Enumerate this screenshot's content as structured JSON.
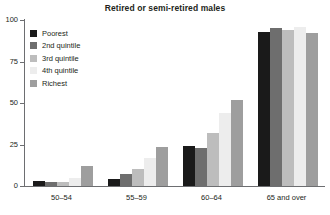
{
  "chart_data": {
    "type": "bar",
    "title": "Retired or semi-retired males",
    "xlabel": "",
    "ylabel": "",
    "ylim": [
      0,
      100
    ],
    "yticks": [
      0,
      25,
      50,
      75,
      100
    ],
    "grid": false,
    "legend_position": "top-left",
    "categories": [
      "50–54",
      "55–59",
      "60–64",
      "65 and over"
    ],
    "series": [
      {
        "name": "Poorest",
        "color": "#1a1a1a",
        "values": [
          3,
          4,
          24,
          92.5
        ]
      },
      {
        "name": "2nd quintile",
        "color": "#6e6e6e",
        "values": [
          2.5,
          7.5,
          23,
          95
        ]
      },
      {
        "name": "3rd quintile",
        "color": "#bdbdbd",
        "values": [
          2.5,
          10.5,
          32,
          94
        ]
      },
      {
        "name": "4th quintile",
        "color": "#ededed",
        "values": [
          5,
          17,
          44,
          96
        ]
      },
      {
        "name": "Richest",
        "color": "#9e9e9e",
        "values": [
          12,
          23.5,
          52,
          92
        ]
      }
    ]
  }
}
